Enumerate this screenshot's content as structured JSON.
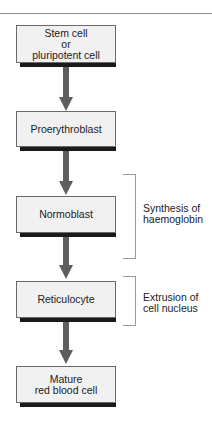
{
  "diagram": {
    "title": "",
    "steps": [
      {
        "label": "Stem cell\nor\npluripotent cell"
      },
      {
        "label": "Proerythroblast"
      },
      {
        "label": "Normoblast"
      },
      {
        "label": "Reticulocyte"
      },
      {
        "label": "Mature\nred blood cell"
      }
    ],
    "annotations": [
      {
        "label": "Synthesis of\nhaemoglobin",
        "spans": "Proerythroblast to Reticulocyte"
      },
      {
        "label": "Extrusion of\ncell nucleus",
        "spans": "Reticulocyte"
      }
    ],
    "colors": {
      "box_fill": "#f1f1f1",
      "box_border": "#6a6a6a",
      "shadow": "#1a1a1a",
      "arrow": "#5e5e5e",
      "bracket": "#9a9a9a"
    }
  }
}
